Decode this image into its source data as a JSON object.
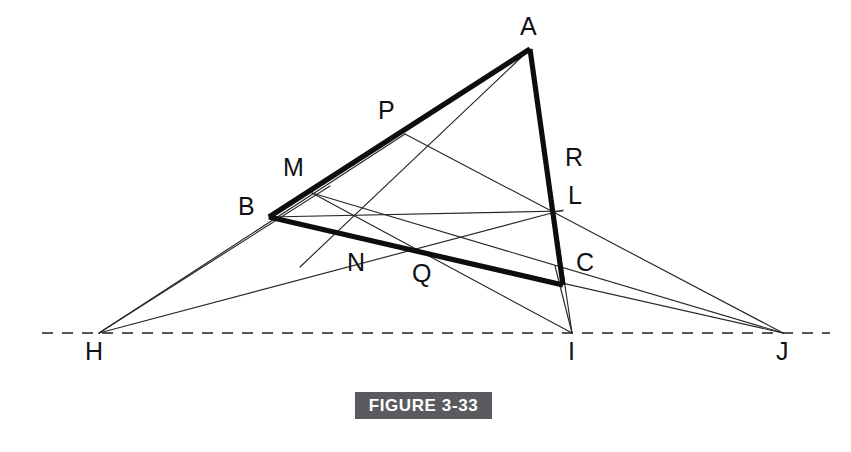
{
  "figure": {
    "caption": "FIGURE 3-33",
    "caption_bg": "#5b5b5f",
    "caption_color": "#ffffff",
    "background": "#ffffff",
    "line_color": "#27272b",
    "bold_line_color": "#0d0d0f",
    "axis_color": "#55555a",
    "type": "geometric-construction"
  },
  "points": {
    "A": {
      "label": "A",
      "x": 530,
      "y": 49,
      "label_x": 520,
      "label_y": 14
    },
    "B": {
      "label": "B",
      "x": 269,
      "y": 217,
      "label_x": 238,
      "label_y": 194
    },
    "C": {
      "label": "C",
      "x": 563,
      "y": 285,
      "label_x": 576,
      "label_y": 250
    },
    "M": {
      "label": "M",
      "x": 315,
      "y": 196,
      "label_x": 283,
      "label_y": 155
    },
    "P": {
      "label": "P",
      "x": 405,
      "y": 134,
      "label_x": 378,
      "label_y": 98
    },
    "N": {
      "label": "N",
      "x": 358,
      "y": 240,
      "label_x": 344,
      "label_y": 250
    },
    "Q": {
      "label": "Q",
      "x": 432,
      "y": 258,
      "label_x": 412,
      "label_y": 261
    },
    "L": {
      "label": "L",
      "x": 557,
      "y": 212,
      "label_x": 570,
      "label_y": 183
    },
    "R": {
      "label": "R",
      "x": 548,
      "y": 176,
      "label_x": 565,
      "label_y": 145
    },
    "H": {
      "label": "H",
      "x": 99,
      "y": 333,
      "label_x": 85,
      "label_y": 339
    },
    "I": {
      "label": "I",
      "x": 572,
      "y": 333,
      "label_x": 568,
      "label_y": 339
    },
    "J": {
      "label": "J",
      "x": 783,
      "y": 333,
      "label_x": 774,
      "label_y": 339
    }
  },
  "axis": {
    "name": "dashed-axis",
    "x1": 42,
    "y1": 333,
    "x2": 830,
    "y2": 333,
    "dash": "11 9"
  },
  "triangle": {
    "name": "triangle-ABC",
    "vertices": [
      "A",
      "B",
      "C"
    ],
    "stroke_width": 5.2
  },
  "thin_lines": [
    {
      "name": "line-A-N",
      "from": "A",
      "to": "N",
      "extend_to": {
        "x": 305,
        "y": 263
      }
    },
    {
      "name": "line-A-Q-I",
      "from": "A",
      "to": "I"
    },
    {
      "name": "line-H-B-M",
      "from": "H",
      "to": "M"
    },
    {
      "name": "line-H-L",
      "from": "H",
      "to": "L"
    },
    {
      "name": "line-B-L",
      "from": "B",
      "to": "L"
    },
    {
      "name": "line-B-J",
      "from": "B",
      "to": "J"
    },
    {
      "name": "line-M-R-J",
      "from": "M",
      "to": "J"
    },
    {
      "name": "line-P-C-J",
      "from": "P",
      "to": "J"
    },
    {
      "name": "line-C-I",
      "from": "C",
      "to": "I"
    },
    {
      "name": "line-M-I",
      "from": "M",
      "to": "I"
    },
    {
      "name": "line-P-N-H",
      "from": "P",
      "to": "H"
    }
  ],
  "labels_order": [
    "A",
    "P",
    "M",
    "B",
    "R",
    "L",
    "N",
    "Q",
    "C",
    "H",
    "I",
    "J"
  ]
}
